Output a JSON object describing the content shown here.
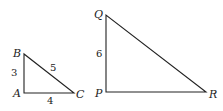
{
  "triangles": [
    {
      "name": "ABC",
      "vertices": {
        "A": {
          "label": "A",
          "x": 24,
          "y": 93
        },
        "B": {
          "label": "B",
          "x": 24,
          "y": 54
        },
        "C": {
          "label": "C",
          "x": 74,
          "y": 93
        }
      },
      "sides": {
        "AB": "3",
        "BC": "5",
        "AC": "4"
      }
    },
    {
      "name": "PQR",
      "vertices": {
        "P": {
          "label": "P",
          "x": 106,
          "y": 92
        },
        "Q": {
          "label": "Q",
          "x": 106,
          "y": 15
        },
        "R": {
          "label": "R",
          "x": 206,
          "y": 92
        }
      },
      "sides": {
        "PQ": "6"
      }
    }
  ]
}
